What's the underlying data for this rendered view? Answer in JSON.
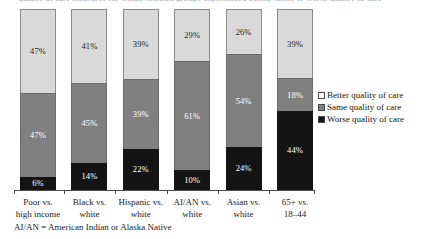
{
  "title_sliver": "quality of care measures for which selected groups experienced better, same, or worse quality of care",
  "footnote": "AI/AN = American Indian or Alaska Native",
  "legend": {
    "position": "right",
    "items": [
      {
        "key": "better",
        "label": "Better quality of care",
        "color": "#d9d9d9"
      },
      {
        "key": "same",
        "label": "Same quality of care",
        "color": "#808080"
      },
      {
        "key": "worse",
        "label": "Worse quality of care",
        "color": "#141414"
      }
    ]
  },
  "chart_data": {
    "type": "bar",
    "subtype": "stacked-100-percent",
    "title": "",
    "xlabel": "",
    "ylabel": "",
    "ylim": [
      0,
      100
    ],
    "grid": false,
    "legend_position": "right",
    "categories": [
      "Poor vs. high income",
      "Black vs. white",
      "Hispanic vs. white",
      "AI/AN vs. white",
      "Asian vs. white",
      "65+ vs. 18–44"
    ],
    "category_lines": [
      [
        "Poor vs.",
        "high income"
      ],
      [
        "Black vs.",
        "white"
      ],
      [
        "Hispanic vs.",
        "white"
      ],
      [
        "AI/AN vs.",
        "white"
      ],
      [
        "Asian vs.",
        "white"
      ],
      [
        "65+ vs.",
        "18–44"
      ]
    ],
    "series": [
      {
        "name": "Better quality of care",
        "color": "#d9d9d9",
        "values": [
          47,
          41,
          39,
          29,
          26,
          39
        ]
      },
      {
        "name": "Same quality of care",
        "color": "#808080",
        "values": [
          47,
          45,
          39,
          61,
          54,
          18
        ]
      },
      {
        "name": "Worse quality of care",
        "color": "#141414",
        "values": [
          6,
          14,
          22,
          10,
          24,
          44
        ]
      }
    ],
    "value_labels": [
      {
        "category": "Poor vs. high income",
        "better": "47%",
        "same": "47%",
        "worse": "6%"
      },
      {
        "category": "Black vs. white",
        "better": "41%",
        "same": "45%",
        "worse": "14%"
      },
      {
        "category": "Hispanic vs. white",
        "better": "39%",
        "same": "39%",
        "worse": "22%"
      },
      {
        "category": "AI/AN vs. white",
        "better": "29%",
        "same": "61%",
        "worse": "10%"
      },
      {
        "category": "Asian vs. white",
        "better": "26%",
        "same": "54%",
        "worse": "24%"
      },
      {
        "category": "65+ vs. 18–44",
        "better": "39%",
        "same": "18%",
        "worse": "44%"
      }
    ]
  }
}
